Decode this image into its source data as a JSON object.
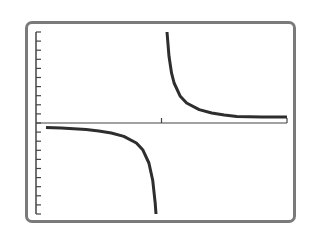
{
  "chart_data": {
    "type": "line",
    "title": "",
    "xlabel": "",
    "ylabel": "",
    "xlim": [
      0,
      2
    ],
    "ylim": [
      -10,
      10
    ],
    "xscl": 1,
    "yscl": 1,
    "grid": false,
    "legend": null,
    "function": "y = 0.44 / (x - 1)",
    "asymptotes": {
      "vertical": 1,
      "horizontal": 0
    },
    "series": [
      {
        "name": "left-branch",
        "x": [
          0.08,
          0.2,
          0.3,
          0.4,
          0.5,
          0.6,
          0.7,
          0.8,
          0.85,
          0.9,
          0.93,
          0.95,
          0.956
        ],
        "y": [
          -0.48,
          -0.55,
          -0.63,
          -0.73,
          -0.88,
          -1.1,
          -1.47,
          -2.2,
          -2.93,
          -4.4,
          -6.29,
          -8.8,
          -10
        ]
      },
      {
        "name": "right-branch",
        "x": [
          1.044,
          1.06,
          1.08,
          1.1,
          1.15,
          1.2,
          1.3,
          1.4,
          1.5,
          1.6,
          1.8,
          2.0
        ],
        "y": [
          10,
          7.33,
          5.5,
          4.4,
          2.93,
          2.2,
          1.47,
          1.1,
          0.88,
          0.73,
          0.55,
          0.44
        ]
      }
    ],
    "style": {
      "curve_color": "#2e2e2e",
      "axis_color": "#444444",
      "frame_color": "#7a7a7a"
    }
  }
}
